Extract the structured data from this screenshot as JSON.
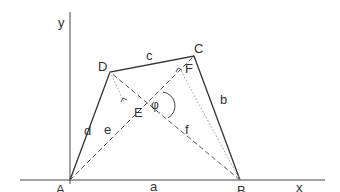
{
  "diagram": {
    "type": "quadrilateral-with-diagonals",
    "axes": {
      "x_label": "x",
      "y_label": "y"
    },
    "vertices": {
      "A": "A",
      "B": "B",
      "C": "C",
      "D": "D"
    },
    "sides": {
      "a": "a",
      "b": "b",
      "c": "c",
      "d": "d"
    },
    "diagonals": {
      "e": "e",
      "f": "f"
    },
    "feet": {
      "E": "E",
      "F": "F"
    },
    "angle": "φ",
    "colors": {
      "line": "#333333",
      "dashed": "#555555",
      "dotted": "#999999"
    }
  }
}
